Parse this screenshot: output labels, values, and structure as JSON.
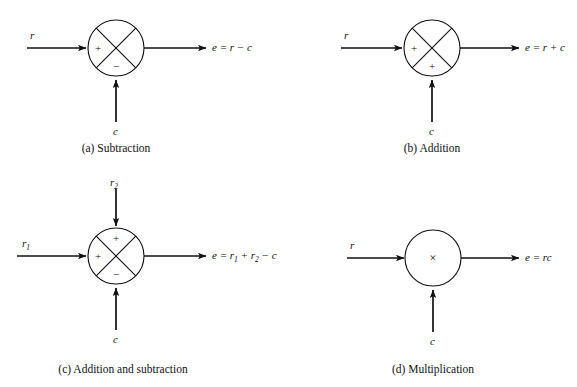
{
  "figure": {
    "background": "#ffffff",
    "ink": "#111111",
    "width": 577,
    "height": 387
  },
  "panels": [
    {
      "id": "a",
      "caption": "(a) Subtraction",
      "node_type": "summing-junction",
      "circle": {
        "cx": 116,
        "cy": 48,
        "r": 28
      },
      "caption_pos": {
        "x": 116,
        "y": 143
      },
      "inputs": [
        {
          "name": "left-input",
          "label": "r",
          "label_html": "r",
          "direction": "left-to-right",
          "sign": "+",
          "sign_pos": {
            "x": 98,
            "y": 48
          },
          "label_pos": {
            "x": 30,
            "y": 30
          },
          "line": {
            "x1": 27,
            "y1": 48,
            "x2": 86,
            "y2": 48
          }
        },
        {
          "name": "bottom-input",
          "label": "c",
          "label_html": "c",
          "direction": "bottom-to-top",
          "sign": "−",
          "sign_pos": {
            "x": 116,
            "y": 66
          },
          "label_pos": {
            "x": 113,
            "y": 126
          },
          "line": {
            "x1": 116,
            "y1": 122,
            "x2": 116,
            "y2": 78
          }
        }
      ],
      "output": {
        "name": "output",
        "equation_html": "e = r − c",
        "label_pos": {
          "x": 212,
          "y": 42
        },
        "line": {
          "x1": 144,
          "y1": 48,
          "x2": 205,
          "y2": 48
        }
      }
    },
    {
      "id": "b",
      "caption": "(b) Addition",
      "node_type": "summing-junction",
      "circle": {
        "cx": 432,
        "cy": 48,
        "r": 28
      },
      "caption_pos": {
        "x": 432,
        "y": 143
      },
      "inputs": [
        {
          "name": "left-input",
          "label": "r",
          "label_html": "r",
          "direction": "left-to-right",
          "sign": "+",
          "sign_pos": {
            "x": 414,
            "y": 48
          },
          "label_pos": {
            "x": 344,
            "y": 30
          },
          "line": {
            "x1": 341,
            "y1": 48,
            "x2": 402,
            "y2": 48
          }
        },
        {
          "name": "bottom-input",
          "label": "c",
          "label_html": "c",
          "direction": "bottom-to-top",
          "sign": "+",
          "sign_pos": {
            "x": 432,
            "y": 66
          },
          "label_pos": {
            "x": 429,
            "y": 126
          },
          "line": {
            "x1": 432,
            "y1": 122,
            "x2": 432,
            "y2": 78
          }
        }
      ],
      "output": {
        "name": "output",
        "equation_html": "e = r + c",
        "label_pos": {
          "x": 525,
          "y": 42
        },
        "line": {
          "x1": 460,
          "y1": 48,
          "x2": 518,
          "y2": 48
        }
      }
    },
    {
      "id": "c",
      "caption": "(c) Addition and subtraction",
      "node_type": "summing-junction",
      "circle": {
        "cx": 116,
        "cy": 256,
        "r": 28
      },
      "caption_pos": {
        "x": 123,
        "y": 364
      },
      "inputs": [
        {
          "name": "left-input",
          "label": "r1",
          "label_html": "r<sub>1</sub>",
          "direction": "left-to-right",
          "sign": "+",
          "sign_pos": {
            "x": 98,
            "y": 256
          },
          "label_pos": {
            "x": 22,
            "y": 238
          },
          "line": {
            "x1": 17,
            "y1": 256,
            "x2": 86,
            "y2": 256
          }
        },
        {
          "name": "top-input",
          "label": "r2",
          "label_html": "r<sub>2</sub>",
          "direction": "top-to-bottom",
          "sign": "+",
          "sign_pos": {
            "x": 116,
            "y": 238
          },
          "label_pos": {
            "x": 110,
            "y": 177
          },
          "line": {
            "x1": 116,
            "y1": 189,
            "x2": 116,
            "y2": 226
          }
        },
        {
          "name": "bottom-input",
          "label": "c",
          "label_html": "c",
          "direction": "bottom-to-top",
          "sign": "−",
          "sign_pos": {
            "x": 116,
            "y": 274
          },
          "label_pos": {
            "x": 113,
            "y": 334
          },
          "line": {
            "x1": 116,
            "y1": 330,
            "x2": 116,
            "y2": 286
          }
        }
      ],
      "output": {
        "name": "output",
        "equation_html": "e = r<sub>1</sub> + r<sub>2</sub> − c",
        "label_pos": {
          "x": 212,
          "y": 250
        },
        "line": {
          "x1": 144,
          "y1": 256,
          "x2": 205,
          "y2": 256
        }
      }
    },
    {
      "id": "d",
      "caption": "(d) Multiplication",
      "node_type": "multiplier",
      "circle": {
        "cx": 433,
        "cy": 258,
        "r": 28
      },
      "center_glyph": "×",
      "caption_pos": {
        "x": 433,
        "y": 364
      },
      "inputs": [
        {
          "name": "left-input",
          "label": "r",
          "label_html": "r",
          "direction": "left-to-right",
          "sign": "",
          "label_pos": {
            "x": 350,
            "y": 240
          },
          "line": {
            "x1": 347,
            "y1": 258,
            "x2": 403,
            "y2": 258
          }
        },
        {
          "name": "bottom-input",
          "label": "c",
          "label_html": "c",
          "direction": "bottom-to-top",
          "sign": "",
          "label_pos": {
            "x": 430,
            "y": 336
          },
          "line": {
            "x1": 433,
            "y1": 332,
            "x2": 433,
            "y2": 288
          }
        }
      ],
      "output": {
        "name": "output",
        "equation_html": "e = rc",
        "label_pos": {
          "x": 525,
          "y": 252
        },
        "line": {
          "x1": 461,
          "y1": 258,
          "x2": 518,
          "y2": 258
        }
      }
    }
  ]
}
